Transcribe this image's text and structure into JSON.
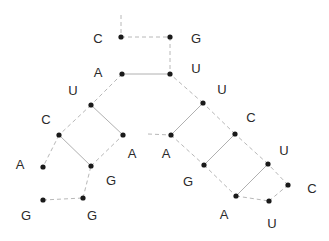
{
  "diagram": {
    "colors": {
      "dot": "#1a1a1a",
      "label": "#2a2a2a",
      "backbone": "#b8b8b8",
      "pair": "#b0b0b0"
    },
    "nucleotides": [
      {
        "id": "n1",
        "base": "C",
        "dot": [
          121,
          37
        ],
        "label": [
          98,
          40
        ]
      },
      {
        "id": "n2",
        "base": "A",
        "dot": [
          122,
          74
        ],
        "label": [
          98,
          74
        ]
      },
      {
        "id": "n3",
        "base": "U",
        "dot": [
          91,
          105
        ],
        "label": [
          73,
          92
        ]
      },
      {
        "id": "n4",
        "base": "C",
        "dot": [
          59,
          135
        ],
        "label": [
          46,
          121
        ]
      },
      {
        "id": "n5",
        "base": "A",
        "dot": [
          43,
          167
        ],
        "label": [
          20,
          166
        ]
      },
      {
        "id": "n6",
        "base": "G",
        "dot": [
          43,
          200
        ],
        "label": [
          26,
          217
        ]
      },
      {
        "id": "n7",
        "base": "G",
        "dot": [
          83,
          198
        ],
        "label": [
          92,
          217
        ]
      },
      {
        "id": "n8",
        "base": "G",
        "dot": [
          91,
          166
        ],
        "label": [
          111,
          182
        ]
      },
      {
        "id": "n9",
        "base": "A",
        "dot": [
          123,
          135
        ],
        "label": [
          132,
          155
        ]
      },
      {
        "id": "n10",
        "base": "A",
        "dot": [
          171,
          135
        ],
        "label": [
          166,
          155
        ]
      },
      {
        "id": "n11",
        "base": "G",
        "dot": [
          204,
          165
        ],
        "label": [
          188,
          183
        ]
      },
      {
        "id": "n12",
        "base": "A",
        "dot": [
          236,
          196
        ],
        "label": [
          224,
          216
        ]
      },
      {
        "id": "n13",
        "base": "U",
        "dot": [
          269,
          201
        ],
        "label": [
          272,
          225
        ]
      },
      {
        "id": "n14",
        "base": "C",
        "dot": [
          288,
          185
        ],
        "label": [
          312,
          190
        ]
      },
      {
        "id": "n15",
        "base": "U",
        "dot": [
          268,
          164
        ],
        "label": [
          284,
          152
        ]
      },
      {
        "id": "n16",
        "base": "C",
        "dot": [
          235,
          134
        ],
        "label": [
          251,
          119
        ]
      },
      {
        "id": "n17",
        "base": "U",
        "dot": [
          203,
          103
        ],
        "label": [
          222,
          91
        ]
      },
      {
        "id": "n18",
        "base": "U",
        "dot": [
          170,
          74
        ],
        "label": [
          196,
          70
        ]
      },
      {
        "id": "n19",
        "base": "G",
        "dot": [
          170,
          37
        ],
        "label": [
          196,
          40
        ]
      }
    ],
    "backbone": [
      {
        "from": [
          121,
          15
        ],
        "to": [
          121,
          37
        ]
      },
      {
        "from": "n1",
        "to": "n19",
        "comment": "top closing"
      },
      {
        "from": "n19",
        "to": "n18"
      },
      {
        "from": "n2",
        "to": "n3"
      },
      {
        "from": "n3",
        "to": "n4"
      },
      {
        "from": "n4",
        "to": "n5"
      },
      {
        "from": "n6",
        "to": "n7"
      },
      {
        "from": "n7",
        "to": "n8"
      },
      {
        "from": "n8",
        "to": "n9"
      },
      {
        "from": [
          148,
          134
        ],
        "to": "n10"
      },
      {
        "from": "n10",
        "to": "n11"
      },
      {
        "from": "n11",
        "to": "n12"
      },
      {
        "from": "n12",
        "to": "n13"
      },
      {
        "from": "n13",
        "to": "n14"
      },
      {
        "from": "n14",
        "to": "n15"
      },
      {
        "from": "n15",
        "to": "n16"
      },
      {
        "from": "n16",
        "to": "n17"
      },
      {
        "from": "n17",
        "to": "n18"
      }
    ],
    "pairs": [
      {
        "from": "n2",
        "to": "n18"
      },
      {
        "from": "n3",
        "to": "n9"
      },
      {
        "from": "n4",
        "to": "n8"
      },
      {
        "from": "n10",
        "to": "n17"
      },
      {
        "from": "n11",
        "to": "n16"
      },
      {
        "from": "n12",
        "to": "n15"
      }
    ]
  }
}
